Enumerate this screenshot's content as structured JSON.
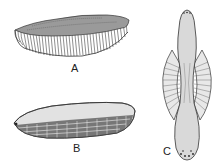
{
  "figure": {
    "panels": [
      {
        "id": "A",
        "label": "A",
        "description": "elongated dome-shaped body with fringe of radiating bristles/cilia below"
      },
      {
        "id": "B",
        "label": "B",
        "description": "oval body with reticulate (brick-like) cell pattern on lower half"
      },
      {
        "id": "C",
        "label": "C",
        "description": "spindle-shaped body with lateral fan-like striated wings and spotted ends"
      }
    ],
    "colors": {
      "ink": "#333333",
      "fill": "#d8d8d8",
      "background": "#ffffff"
    }
  }
}
